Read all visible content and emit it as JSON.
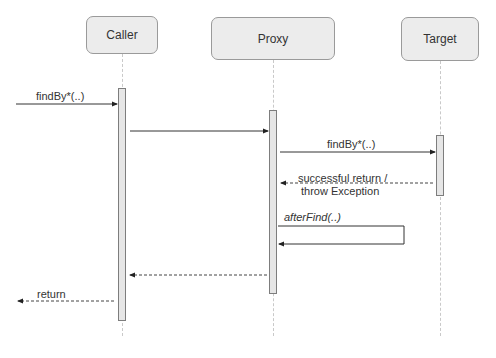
{
  "diagram": {
    "type": "sequence",
    "participants": [
      {
        "id": "caller",
        "label": "Caller"
      },
      {
        "id": "proxy",
        "label": "Proxy"
      },
      {
        "id": "target",
        "label": "Target"
      }
    ],
    "messages": [
      {
        "from": "external",
        "to": "caller",
        "label": "findBy*(..)",
        "style": "solid"
      },
      {
        "from": "caller",
        "to": "proxy",
        "label": "",
        "style": "solid"
      },
      {
        "from": "proxy",
        "to": "target",
        "label": "findBy*(..)",
        "style": "solid"
      },
      {
        "from": "target",
        "to": "proxy",
        "label_line1": "successful return /",
        "label_line2": "throw Exception",
        "style": "dashed"
      },
      {
        "from": "proxy",
        "to": "proxy",
        "label": "afterFind(..)",
        "style": "solid-self"
      },
      {
        "from": "proxy",
        "to": "caller",
        "label": "",
        "style": "dashed"
      },
      {
        "from": "caller",
        "to": "external",
        "label": "return",
        "style": "dashed"
      }
    ]
  }
}
